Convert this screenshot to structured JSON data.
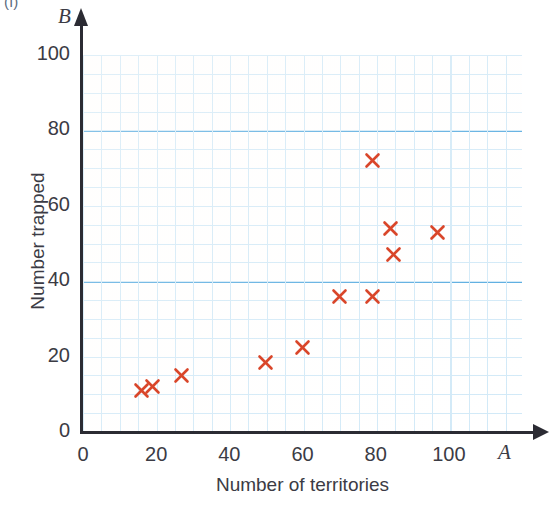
{
  "figure": {
    "part_label": "(i)"
  },
  "chart_data": {
    "type": "scatter",
    "title": "",
    "xlabel": "Number of territories",
    "ylabel": "Number trapped",
    "x_axis_variable": "A",
    "y_axis_variable": "B",
    "xlim": [
      0,
      120
    ],
    "ylim": [
      0,
      100
    ],
    "xticks": [
      0,
      20,
      40,
      60,
      80,
      100
    ],
    "xtick_labels": [
      "0",
      "20",
      "40",
      "60",
      "80",
      "100"
    ],
    "yticks": [
      0,
      20,
      40,
      60,
      80,
      100
    ],
    "ytick_labels": [
      "0",
      "20",
      "40",
      "60",
      "80",
      "100"
    ],
    "grid": true,
    "grid_major_step": 20,
    "grid_minor_step": 5,
    "legend": null,
    "marker_style": "x",
    "marker_color": "#d9462a",
    "grid_major_color": "#4da6de",
    "grid_minor_color": "#cfe8f7",
    "axis_color": "#2b2b33",
    "points": [
      {
        "x": 16,
        "y": 11
      },
      {
        "x": 19,
        "y": 12
      },
      {
        "x": 27,
        "y": 15
      },
      {
        "x": 50,
        "y": 18.5
      },
      {
        "x": 60,
        "y": 22.5
      },
      {
        "x": 70,
        "y": 36
      },
      {
        "x": 79,
        "y": 36
      },
      {
        "x": 79,
        "y": 72
      },
      {
        "x": 84,
        "y": 54
      },
      {
        "x": 85,
        "y": 47
      },
      {
        "x": 97,
        "y": 53
      }
    ]
  }
}
